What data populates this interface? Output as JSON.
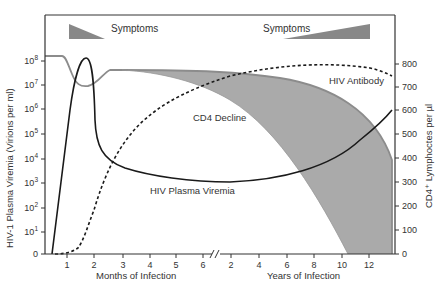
{
  "chart_data": {
    "type": "line",
    "title": "",
    "x_axis": {
      "segments": [
        {
          "label": "Months of Infection",
          "ticks": [
            "1",
            "2",
            "3",
            "4",
            "5",
            "6"
          ]
        },
        {
          "label": "Years of Infection",
          "ticks": [
            "2",
            "4",
            "6",
            "8",
            "10",
            "12"
          ]
        }
      ],
      "break_marker": "//"
    },
    "y_left": {
      "label": "HIV-1 Plasma Viremia (Virions per ml)",
      "ticks": [
        "0",
        "10¹",
        "10²",
        "10³",
        "10⁴",
        "10⁵",
        "10⁶",
        "10⁷",
        "10⁸"
      ],
      "scale": "log"
    },
    "y_right": {
      "label": "CD4⁺ Lymphoctes per µl",
      "ticks": [
        "0",
        "100",
        "200",
        "300",
        "400",
        "500",
        "600",
        "700",
        "800"
      ],
      "ylim": [
        0,
        800
      ]
    },
    "series": [
      {
        "name": "HIV Plasma Viremia",
        "style": "solid black",
        "axis": "left",
        "points": [
          [
            "0.5 mo",
            "0"
          ],
          [
            "1.8 mo",
            "10^8"
          ],
          [
            "2.2 mo",
            "10^5"
          ],
          [
            "3 mo",
            "10^4"
          ],
          [
            "6 mo",
            "10^3"
          ],
          [
            "6 yr",
            "10^3.5"
          ],
          [
            "13 yr",
            "10^6"
          ]
        ]
      },
      {
        "name": "HIV Antibody",
        "style": "dashed black",
        "axis": "right",
        "points": [
          [
            "0.5 mo",
            0
          ],
          [
            "1.3 mo",
            30
          ],
          [
            "2 mo",
            300
          ],
          [
            "3 mo",
            480
          ],
          [
            "5 mo",
            680
          ],
          [
            "4 yr",
            790
          ],
          [
            "8 yr",
            800
          ],
          [
            "13 yr",
            760
          ]
        ]
      },
      {
        "name": "CD4 Decline",
        "style": "gray band",
        "axis": "right",
        "upper": [
          [
            "0 mo",
            930
          ],
          [
            "1 mo",
            930
          ],
          [
            "1.5 mo",
            760
          ],
          [
            "2.5 mo",
            900
          ],
          [
            "6 yr",
            800
          ],
          [
            "13 yr",
            400
          ]
        ],
        "lower": [
          [
            "2.5 mo",
            900
          ],
          [
            "6 mo",
            800
          ],
          [
            "4 yr",
            450
          ],
          [
            "10.5 yr",
            0
          ],
          [
            "13 yr",
            0
          ]
        ]
      }
    ],
    "annotations": [
      {
        "text": "Symptoms",
        "position": "top-left",
        "triangle": "decreasing"
      },
      {
        "text": "Symptoms",
        "position": "top-right",
        "triangle": "increasing"
      },
      {
        "text": "CD4 Decline"
      },
      {
        "text": "HIV Antibody"
      },
      {
        "text": "HIV Plasma Viremia"
      }
    ],
    "grid": false
  },
  "labels": {
    "symptoms_left": "Symptoms",
    "symptoms_right": "Symptoms",
    "cd4_decline": "CD4 Decline",
    "hiv_antibody": "HIV Antibody",
    "hiv_viremia": "HIV Plasma Viremia",
    "x_months": "Months of Infection",
    "x_years": "Years of Infection",
    "y_left": "HIV-1 Plasma Viremia (Virions per ml)",
    "y_right": "CD4⁺ Lymphoctes per µl"
  },
  "ticks": {
    "left": [
      {
        "label": "10",
        "sup": "8",
        "y": 61
      },
      {
        "label": "10",
        "sup": "7",
        "y": 85
      },
      {
        "label": "10",
        "sup": "6",
        "y": 109
      },
      {
        "label": "10",
        "sup": "5",
        "y": 134
      },
      {
        "label": "10",
        "sup": "4",
        "y": 159
      },
      {
        "label": "10",
        "sup": "3",
        "y": 183
      },
      {
        "label": "10",
        "sup": "2",
        "y": 208
      },
      {
        "label": "10",
        "sup": "1",
        "y": 232
      },
      {
        "label": "0",
        "sup": "",
        "y": 254
      }
    ],
    "right": [
      {
        "label": "800",
        "y": 64
      },
      {
        "label": "700",
        "y": 87
      },
      {
        "label": "600",
        "y": 110
      },
      {
        "label": "500",
        "y": 134
      },
      {
        "label": "400",
        "y": 158
      },
      {
        "label": "300",
        "y": 182
      },
      {
        "label": "200",
        "y": 206
      },
      {
        "label": "100",
        "y": 230
      },
      {
        "label": "0",
        "y": 254
      }
    ],
    "bottom": [
      {
        "label": "1",
        "x": 67
      },
      {
        "label": "2",
        "x": 94
      },
      {
        "label": "3",
        "x": 123
      },
      {
        "label": "4",
        "x": 150
      },
      {
        "label": "5",
        "x": 176
      },
      {
        "label": "6",
        "x": 203
      },
      {
        "label": "2",
        "x": 231
      },
      {
        "label": "4",
        "x": 259
      },
      {
        "label": "6",
        "x": 287
      },
      {
        "label": "8",
        "x": 314
      },
      {
        "label": "10",
        "x": 342
      },
      {
        "label": "12",
        "x": 369
      }
    ]
  },
  "colors": {
    "band_fill": "#aaaaaa",
    "band_edge": "#8c8c8c",
    "line": "#1a1a1a",
    "axis": "#333333",
    "triangle": "#888888"
  }
}
